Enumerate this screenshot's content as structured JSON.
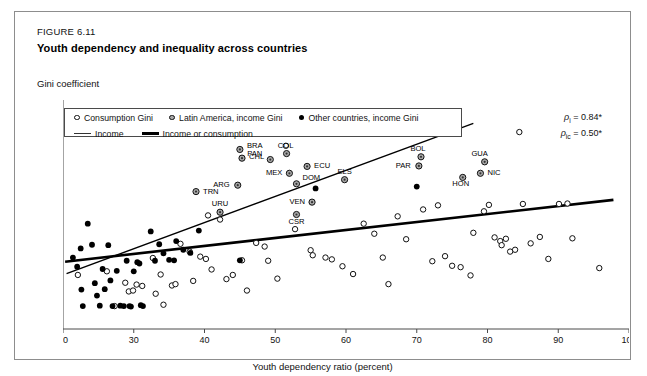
{
  "figure": {
    "number": "FIGURE 6.11",
    "title": "Youth dependency and inequality across countries"
  },
  "axes": {
    "y_title": "Gini coefficient",
    "x_title": "Youth dependency ratio (percent)"
  },
  "legend": {
    "items": [
      {
        "marker": "open-circle",
        "label": "Consumption Gini"
      },
      {
        "marker": "grey-circle",
        "label": "Latin America, income Gini"
      },
      {
        "marker": "black-circle",
        "label": "Other countries, income Gini"
      },
      {
        "marker": "thin-line",
        "label": "Income"
      },
      {
        "marker": "thick-line",
        "label": "Income or consumption"
      }
    ]
  },
  "annotations": {
    "rho_income_symbol": "ρ",
    "rho_income_sub": "i",
    "rho_income_value": "= 0.84*",
    "rho_inccons_symbol": "ρ",
    "rho_inccons_sub": "ic",
    "rho_inccons_value": "= 0.50*"
  },
  "chart_data": {
    "type": "scatter",
    "title": "Youth dependency and inequality across countries",
    "xlabel": "Youth dependency ratio (percent)",
    "ylabel": "Gini coefficient",
    "xlim": [
      20,
      100
    ],
    "ylim": [
      20,
      70
    ],
    "xticks": [
      20,
      30,
      40,
      50,
      60,
      70,
      80,
      90,
      100
    ],
    "yticks": [
      20,
      25,
      30,
      35,
      40,
      45,
      50,
      55,
      60,
      65,
      70
    ],
    "grid": false,
    "legend_position": "top-left",
    "series": [
      {
        "name": "Latin America, income Gini",
        "marker": "grey-circle",
        "points": [
          {
            "label": "BRA",
            "x": 45.0,
            "y": 59.2
          },
          {
            "label": "CHL",
            "x": 45.3,
            "y": 57.3
          },
          {
            "label": "COL",
            "x": 51.6,
            "y": 58.3
          },
          {
            "label": "PAN",
            "x": 49.3,
            "y": 57.0
          },
          {
            "label": "ECU",
            "x": 54.5,
            "y": 55.5
          },
          {
            "label": "MEX",
            "x": 52.0,
            "y": 54.0
          },
          {
            "label": "ARG",
            "x": 44.7,
            "y": 51.4
          },
          {
            "label": "DOM",
            "x": 53.0,
            "y": 51.7
          },
          {
            "label": "ELS",
            "x": 59.8,
            "y": 52.6
          },
          {
            "label": "VEN",
            "x": 55.2,
            "y": 47.7
          },
          {
            "label": "CSR",
            "x": 53.0,
            "y": 45.0
          },
          {
            "label": "TRN",
            "x": 38.8,
            "y": 50.0
          },
          {
            "label": "URU",
            "x": 42.2,
            "y": 45.5
          },
          {
            "label": "BOL",
            "x": 70.6,
            "y": 57.6
          },
          {
            "label": "PAR",
            "x": 70.3,
            "y": 55.6
          },
          {
            "label": "GUA",
            "x": 79.6,
            "y": 56.5
          },
          {
            "label": "NIC",
            "x": 79.0,
            "y": 54.0
          },
          {
            "label": "HON",
            "x": 76.5,
            "y": 53.1
          }
        ]
      },
      {
        "name": "Other countries, income Gini",
        "marker": "black-circle",
        "points": [
          {
            "x": 21.4,
            "y": 35.6
          },
          {
            "x": 22.0,
            "y": 33.6
          },
          {
            "x": 22.5,
            "y": 37.6
          },
          {
            "x": 22.6,
            "y": 28.6
          },
          {
            "x": 22.8,
            "y": 25.0
          },
          {
            "x": 23.5,
            "y": 43.0
          },
          {
            "x": 24.1,
            "y": 38.4
          },
          {
            "x": 24.5,
            "y": 30.0
          },
          {
            "x": 24.8,
            "y": 27.3
          },
          {
            "x": 25.2,
            "y": 25.1
          },
          {
            "x": 25.6,
            "y": 33.1
          },
          {
            "x": 25.9,
            "y": 28.7
          },
          {
            "x": 26.4,
            "y": 38.3
          },
          {
            "x": 26.7,
            "y": 30.6
          },
          {
            "x": 27.0,
            "y": 25.0
          },
          {
            "x": 27.6,
            "y": 32.7
          },
          {
            "x": 28.1,
            "y": 25.1
          },
          {
            "x": 28.6,
            "y": 25.0
          },
          {
            "x": 29.0,
            "y": 34.9
          },
          {
            "x": 29.4,
            "y": 25.0
          },
          {
            "x": 29.6,
            "y": 24.9
          },
          {
            "x": 30.0,
            "y": 32.6
          },
          {
            "x": 30.5,
            "y": 34.6
          },
          {
            "x": 30.8,
            "y": 34.3
          },
          {
            "x": 31.0,
            "y": 25.2
          },
          {
            "x": 31.3,
            "y": 25.0
          },
          {
            "x": 32.4,
            "y": 41.3
          },
          {
            "x": 33.0,
            "y": 34.9
          },
          {
            "x": 33.6,
            "y": 38.5
          },
          {
            "x": 34.2,
            "y": 36.5
          },
          {
            "x": 35.0,
            "y": 35.1
          },
          {
            "x": 35.7,
            "y": 35.0
          },
          {
            "x": 36.0,
            "y": 39.2
          },
          {
            "x": 37.0,
            "y": 37.3
          },
          {
            "x": 38.0,
            "y": 36.6
          },
          {
            "x": 39.2,
            "y": 41.5
          },
          {
            "x": 45.0,
            "y": 35.0
          },
          {
            "x": 55.7,
            "y": 50.7
          },
          {
            "x": 70.0,
            "y": 51.1
          }
        ]
      },
      {
        "name": "Consumption Gini",
        "marker": "open-circle",
        "points": [
          {
            "x": 22.1,
            "y": 31.8
          },
          {
            "x": 26.2,
            "y": 32.6
          },
          {
            "x": 27.3,
            "y": 25.0
          },
          {
            "x": 28.8,
            "y": 30.1
          },
          {
            "x": 29.3,
            "y": 28.2
          },
          {
            "x": 29.9,
            "y": 28.4
          },
          {
            "x": 30.4,
            "y": 29.7
          },
          {
            "x": 31.2,
            "y": 29.4
          },
          {
            "x": 32.7,
            "y": 35.5
          },
          {
            "x": 33.1,
            "y": 27.7
          },
          {
            "x": 34.2,
            "y": 25.3
          },
          {
            "x": 36.6,
            "y": 38.6
          },
          {
            "x": 37.9,
            "y": 36.9
          },
          {
            "x": 39.4,
            "y": 35.8
          },
          {
            "x": 40.2,
            "y": 35.3
          },
          {
            "x": 41.0,
            "y": 33.0
          },
          {
            "x": 42.2,
            "y": 43.9
          },
          {
            "x": 43.1,
            "y": 30.9
          },
          {
            "x": 44.0,
            "y": 31.8
          },
          {
            "x": 45.3,
            "y": 35.0
          },
          {
            "x": 47.3,
            "y": 38.8
          },
          {
            "x": 48.5,
            "y": 38.0
          },
          {
            "x": 49.0,
            "y": 34.9
          },
          {
            "x": 51.5,
            "y": 60.0
          },
          {
            "x": 50.3,
            "y": 31.0
          },
          {
            "x": 52.8,
            "y": 41.8
          },
          {
            "x": 55.0,
            "y": 37.2
          },
          {
            "x": 55.3,
            "y": 36.1
          },
          {
            "x": 57.1,
            "y": 35.6
          },
          {
            "x": 58.0,
            "y": 35.2
          },
          {
            "x": 59.5,
            "y": 33.7
          },
          {
            "x": 61.0,
            "y": 32.0
          },
          {
            "x": 62.5,
            "y": 43.0
          },
          {
            "x": 64.0,
            "y": 40.8
          },
          {
            "x": 65.2,
            "y": 35.6
          },
          {
            "x": 66.0,
            "y": 29.8
          },
          {
            "x": 67.3,
            "y": 44.6
          },
          {
            "x": 68.5,
            "y": 39.6
          },
          {
            "x": 70.9,
            "y": 46.1
          },
          {
            "x": 72.2,
            "y": 34.8
          },
          {
            "x": 73.0,
            "y": 47.0
          },
          {
            "x": 74.0,
            "y": 35.9
          },
          {
            "x": 75.0,
            "y": 33.8
          },
          {
            "x": 76.2,
            "y": 33.5
          },
          {
            "x": 77.6,
            "y": 31.7
          },
          {
            "x": 78.0,
            "y": 41.0
          },
          {
            "x": 79.5,
            "y": 45.7
          },
          {
            "x": 80.2,
            "y": 47.1
          },
          {
            "x": 81.0,
            "y": 40.0
          },
          {
            "x": 81.8,
            "y": 39.2
          },
          {
            "x": 82.0,
            "y": 38.3
          },
          {
            "x": 82.6,
            "y": 39.7
          },
          {
            "x": 83.2,
            "y": 36.9
          },
          {
            "x": 83.9,
            "y": 37.3
          },
          {
            "x": 84.5,
            "y": 63.0
          },
          {
            "x": 85.0,
            "y": 47.3
          },
          {
            "x": 86.1,
            "y": 38.7
          },
          {
            "x": 87.4,
            "y": 40.1
          },
          {
            "x": 88.6,
            "y": 35.3
          },
          {
            "x": 90.1,
            "y": 47.3
          },
          {
            "x": 91.3,
            "y": 47.4
          },
          {
            "x": 92.0,
            "y": 39.8
          },
          {
            "x": 95.8,
            "y": 33.3
          },
          {
            "x": 40.5,
            "y": 44.8
          },
          {
            "x": 46.0,
            "y": 28.4
          },
          {
            "x": 38.4,
            "y": 30.5
          },
          {
            "x": 35.4,
            "y": 29.5
          },
          {
            "x": 35.9,
            "y": 29.8
          },
          {
            "x": 33.8,
            "y": 31.9
          }
        ]
      }
    ],
    "trendlines": [
      {
        "name": "Income",
        "style": "thin",
        "x_start": 20.5,
        "y_start": 32.1,
        "x_end": 78.0,
        "y_end": 64.9
      },
      {
        "name": "Income or consumption",
        "style": "thick",
        "x_start": 20.3,
        "y_start": 34.7,
        "x_end": 97.8,
        "y_end": 48.2
      }
    ]
  }
}
